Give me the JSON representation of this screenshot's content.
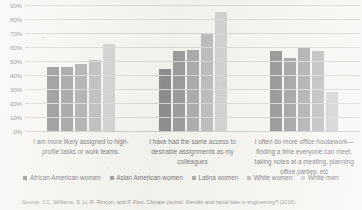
{
  "chart_data": {
    "type": "bar",
    "title": "",
    "subtitle": "",
    "xlabel": "",
    "ylabel": "",
    "ylim": [
      0,
      90
    ],
    "grid": true,
    "legend_position": "bottom",
    "orientation": "vertical",
    "grouping": "grouped",
    "categories": [
      "I am more likely assigned to high-profile tasks or work teams.",
      "I have had the same access to desirable assignments as my colleagues",
      "I often do more office housework—finding a time everyone can meet, taking notes at a meeting, planning office parties, etc"
    ],
    "yticks": [
      "0%",
      "10%",
      "20%",
      "30%",
      "40%",
      "50%",
      "60%",
      "70%",
      "80%",
      "90%"
    ],
    "ytick_values": [
      0,
      10,
      20,
      30,
      40,
      50,
      60,
      70,
      80,
      90
    ],
    "series": [
      {
        "name": "African American women",
        "color": "#595959",
        "values": [
          46,
          44,
          57
        ]
      },
      {
        "name": "Asian American women",
        "color": "#6e6e6e",
        "values": [
          46,
          57,
          52
        ]
      },
      {
        "name": "Latina women",
        "color": "#848484",
        "values": [
          48,
          58,
          59
        ]
      },
      {
        "name": "White women",
        "color": "#9d9d9d",
        "values": [
          51,
          69,
          57
        ]
      },
      {
        "name": "White men",
        "color": "#bcbcbc",
        "values": [
          62,
          85,
          28
        ]
      }
    ],
    "source": "Source: J.C. Williams, S. Li, R. Rincon, and P. Finn. Climate control: Gender and racial bias in engineering? (2016)"
  }
}
